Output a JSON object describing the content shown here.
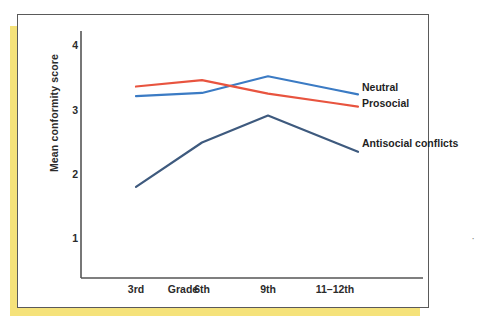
{
  "figure": {
    "background_color": "#ffffff",
    "border_color": "#5a5a5a",
    "page_shadow_color": "#f5e27a",
    "scan_mark": "·"
  },
  "chart_data": {
    "type": "line",
    "title": "",
    "xlabel": "Grade",
    "ylabel": "Mean conformity score",
    "categories": [
      "3rd",
      "6th",
      "9th",
      "11–12th"
    ],
    "ylim": [
      0.45,
      4.35
    ],
    "yticks": [
      1,
      2,
      3,
      4
    ],
    "ytick_labels": [
      "1",
      "2",
      "3",
      "4"
    ],
    "grid": false,
    "legend_position": "right-inline",
    "series": [
      {
        "name": "Neutral",
        "color": "#3b7bc4",
        "values": [
          3.22,
          3.27,
          3.53,
          3.32
        ]
      },
      {
        "name": "Prosocial",
        "color": "#e8543f",
        "values": [
          3.37,
          3.47,
          3.26,
          3.11
        ]
      },
      {
        "name": "Antisocial conflicts",
        "color": "#3e5a7e",
        "values": [
          1.81,
          2.5,
          2.92,
          2.5
        ]
      }
    ]
  },
  "labels": {
    "y_axis_title": "Mean conformity score",
    "x_axis_title": "Grade",
    "y_tick_4": "4",
    "y_tick_3": "3",
    "y_tick_2": "2",
    "y_tick_1": "1",
    "x_tick_1": "3rd",
    "x_tick_2": "6th",
    "x_tick_3": "9th",
    "x_tick_4": "11–12th",
    "series_neutral": "Neutral",
    "series_prosocial": "Prosocial",
    "series_antisocial": "Antisocial conflicts"
  }
}
